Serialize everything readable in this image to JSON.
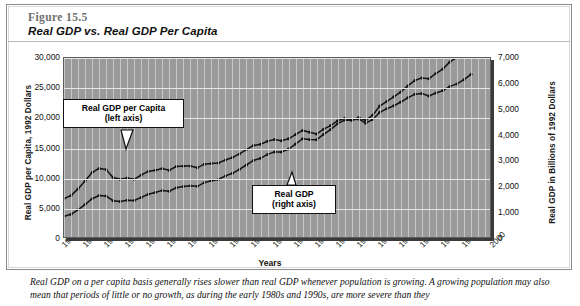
{
  "figure": {
    "number": "Figure 15.5",
    "title": "Real GDP vs. Real GDP Per Capita",
    "caption": "Real GDP on a per capita basis generally rises slower than real GDP whenever population is growing. A growing population may also mean that periods of little or no growth, as during the early 1980s and 1990s, are more severe than they"
  },
  "callouts": {
    "per_capita": {
      "line1": "Real GDP per Capita",
      "line2": "(left axis)"
    },
    "gdp": {
      "line1": "Real GDP",
      "line2": "(right axis)"
    }
  },
  "chart_data": {
    "type": "line",
    "title": "Real GDP vs. Real GDP Per Capita",
    "xlabel": "Years",
    "ylabel": "Real GDP per Capita, 1992 Dollars",
    "y2label": "Real GDP in Billions of 1992 Dollars",
    "grid": true,
    "legend_position": "inline-callouts",
    "xlim": [
      1939,
      2000
    ],
    "ylim": [
      0,
      30000
    ],
    "y2lim": [
      0,
      7000
    ],
    "yticks": [
      "0",
      "5,000",
      "10,000",
      "15,000",
      "20,000",
      "25,000",
      "30,000"
    ],
    "ytick_values": [
      0,
      5000,
      10000,
      15000,
      20000,
      25000,
      30000
    ],
    "y2ticks": [
      "0",
      "1,000",
      "2,000",
      "3,000",
      "4,000",
      "5,000",
      "6,000",
      "7,000"
    ],
    "y2tick_values": [
      0,
      1000,
      2000,
      3000,
      4000,
      5000,
      6000,
      7000
    ],
    "xticks": [
      "1939",
      "1942",
      "1945",
      "1948",
      "1951",
      "1954",
      "1957",
      "1960",
      "1963",
      "1966",
      "1969",
      "1972",
      "1975",
      "1978",
      "1981",
      "1984",
      "1987",
      "1990",
      "1993",
      "1996",
      "2000"
    ],
    "xtick_values": [
      1939,
      1942,
      1945,
      1948,
      1951,
      1954,
      1957,
      1960,
      1963,
      1966,
      1969,
      1972,
      1975,
      1978,
      1981,
      1984,
      1987,
      1990,
      1993,
      1996,
      2000
    ],
    "x": [
      1939,
      1940,
      1941,
      1942,
      1943,
      1944,
      1945,
      1946,
      1947,
      1948,
      1949,
      1950,
      1951,
      1952,
      1953,
      1954,
      1955,
      1956,
      1957,
      1958,
      1959,
      1960,
      1961,
      1962,
      1963,
      1964,
      1965,
      1966,
      1967,
      1968,
      1969,
      1970,
      1971,
      1972,
      1973,
      1974,
      1975,
      1976,
      1977,
      1978,
      1979,
      1980,
      1981,
      1982,
      1983,
      1984,
      1985,
      1986,
      1987,
      1988,
      1989,
      1990,
      1991,
      1992,
      1993,
      1994,
      1995,
      1996,
      1997
    ],
    "series": [
      {
        "name": "Real GDP per Capita",
        "axis": "left",
        "units": "1992 dollars",
        "values": [
          6700,
          7200,
          8300,
          9600,
          11000,
          11700,
          11500,
          10200,
          9900,
          10100,
          9900,
          10600,
          11200,
          11400,
          11700,
          11400,
          12000,
          12100,
          12100,
          11800,
          12400,
          12500,
          12600,
          13100,
          13500,
          14100,
          14800,
          15500,
          15700,
          16200,
          16500,
          16300,
          16600,
          17300,
          18000,
          17700,
          17400,
          18200,
          18800,
          19600,
          20000,
          19700,
          19900,
          19200,
          19800,
          21000,
          21600,
          22100,
          22700,
          23400,
          24000,
          24100,
          23700,
          24200,
          24600,
          25300,
          25700,
          26400,
          27300
        ]
      },
      {
        "name": "Real GDP",
        "axis": "right",
        "units": "billions of 1992 dollars",
        "values": [
          880,
          960,
          1130,
          1330,
          1560,
          1680,
          1660,
          1480,
          1450,
          1500,
          1490,
          1610,
          1730,
          1800,
          1880,
          1850,
          1980,
          2030,
          2060,
          2040,
          2180,
          2250,
          2300,
          2440,
          2540,
          2690,
          2860,
          3040,
          3120,
          3270,
          3370,
          3370,
          3480,
          3670,
          3880,
          3850,
          3840,
          4050,
          4230,
          4460,
          4600,
          4590,
          4700,
          4590,
          4790,
          5140,
          5320,
          5500,
          5690,
          5920,
          6130,
          6230,
          6200,
          6400,
          6580,
          6850,
          7020,
          7260,
          7590
        ]
      }
    ]
  }
}
